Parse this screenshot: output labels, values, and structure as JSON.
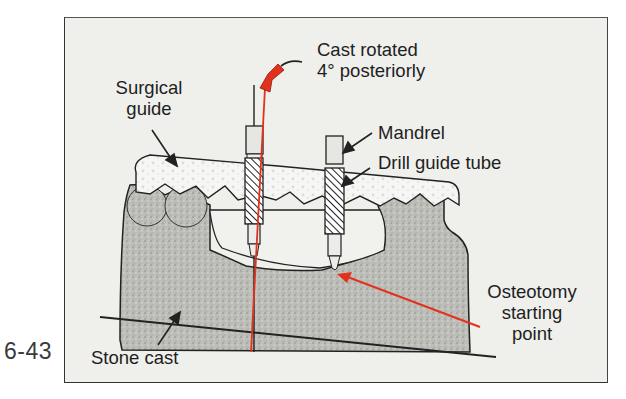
{
  "figure": {
    "number": "6-43",
    "colors": {
      "background": "#efefec",
      "stone": "#bdbdb8",
      "guide": "#f4f4f2",
      "accent_red": "#e2321e",
      "outline": "#222222"
    }
  },
  "labels": {
    "cast_rotated_line1": "Cast rotated",
    "cast_rotated_line2": "4° posteriorly",
    "surgical_guide_line1": "Surgical",
    "surgical_guide_line2": "guide",
    "mandrel": "Mandrel",
    "drill_guide_tube": "Drill guide tube",
    "osteotomy_line1": "Osteotomy",
    "osteotomy_line2": "starting",
    "osteotomy_line3": "point",
    "stone_cast": "Stone cast"
  }
}
